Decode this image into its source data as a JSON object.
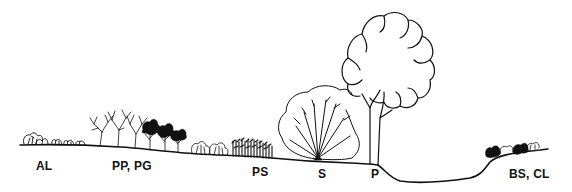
{
  "figure": {
    "type": "vegetation-profile-transect",
    "background": "#ffffff",
    "ink_color": "#111111"
  },
  "zones": [
    {
      "id": "al",
      "label": "AL",
      "description": "low scattered shrubs on level ground"
    },
    {
      "id": "pp-pg",
      "label": "PP, PG",
      "description": "open leafless trees and dark-crowned shrubs"
    },
    {
      "id": "ps",
      "label": "PS",
      "description": "dense dark thicket of small stems"
    },
    {
      "id": "s",
      "label": "S",
      "description": "multi-stemmed broad shrub radiating from one base"
    },
    {
      "id": "p",
      "label": "P",
      "description": "large tree with billowing crown"
    },
    {
      "id": "bs-cl",
      "label": "BS, CL",
      "description": "low shrubs on raised bank beyond depression"
    }
  ]
}
